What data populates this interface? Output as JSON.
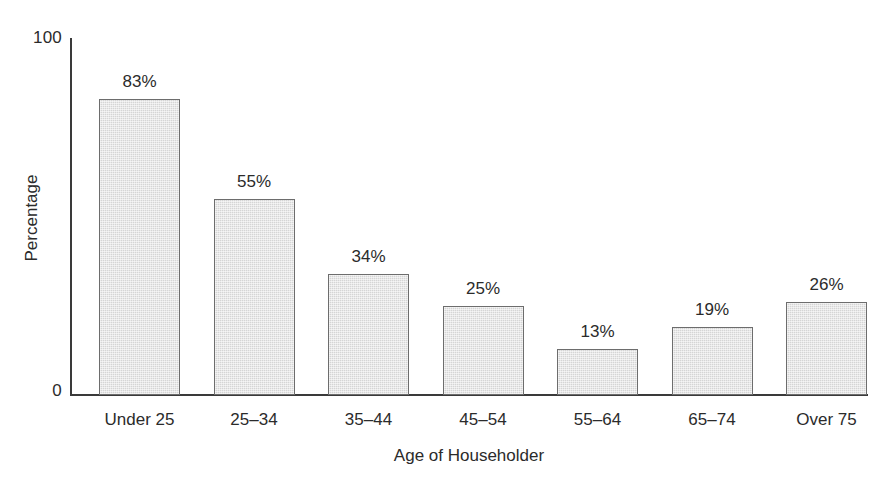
{
  "chart_data": {
    "type": "bar",
    "title": "",
    "xlabel": "Age of Householder",
    "ylabel": "Percentage",
    "categories": [
      "Under 25",
      "25–34",
      "35–44",
      "45–54",
      "55–64",
      "65–74",
      "Over 75"
    ],
    "values": [
      83,
      55,
      34,
      25,
      13,
      19,
      26
    ],
    "value_labels": [
      "83%",
      "55%",
      "34%",
      "25%",
      "13%",
      "19%",
      "26%"
    ],
    "ylim": [
      0,
      100
    ],
    "ytick_labels": [
      "100",
      "0"
    ],
    "ytick_values": [
      100,
      0
    ],
    "grid": false,
    "legend": false,
    "bar_fill_color": "#d5d5d5",
    "bar_border_color": "#6d6d6d",
    "axis_color": "#3a3a3a",
    "text_color": "#2b2b2b",
    "background_color": "#ffffff"
  }
}
